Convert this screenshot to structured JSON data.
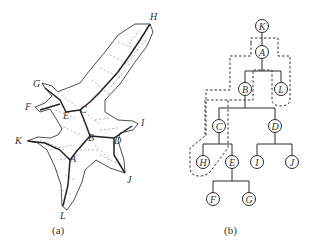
{
  "figure_a": {
    "caption": "(a)",
    "vertex_labels": [
      {
        "id": "H",
        "x": 150,
        "y": 20
      },
      {
        "id": "G",
        "x": 33,
        "y": 87
      },
      {
        "id": "F",
        "x": 25,
        "y": 110
      },
      {
        "id": "C",
        "x": 80,
        "y": 113
      },
      {
        "id": "E",
        "x": 63,
        "y": 119
      },
      {
        "id": "I",
        "x": 141,
        "y": 126
      },
      {
        "id": "K",
        "x": 15,
        "y": 144
      },
      {
        "id": "B",
        "x": 88,
        "y": 141
      },
      {
        "id": "D",
        "x": 114,
        "y": 144
      },
      {
        "id": "A",
        "x": 70,
        "y": 162
      },
      {
        "id": "J",
        "x": 127,
        "y": 183
      },
      {
        "id": "L",
        "x": 60,
        "y": 219
      }
    ]
  },
  "figure_b": {
    "caption": "(b)",
    "nodes": [
      {
        "id": "K",
        "x": 262,
        "y": 26
      },
      {
        "id": "A",
        "x": 262,
        "y": 52
      },
      {
        "id": "B",
        "x": 245,
        "y": 89
      },
      {
        "id": "L",
        "x": 281,
        "y": 89
      },
      {
        "id": "C",
        "x": 219,
        "y": 126
      },
      {
        "id": "D",
        "x": 275,
        "y": 126
      },
      {
        "id": "H",
        "x": 203,
        "y": 162
      },
      {
        "id": "E",
        "x": 232,
        "y": 162
      },
      {
        "id": "I",
        "x": 257,
        "y": 162
      },
      {
        "id": "J",
        "x": 292,
        "y": 162
      },
      {
        "id": "F",
        "x": 213,
        "y": 199
      },
      {
        "id": "G",
        "x": 249,
        "y": 199
      }
    ],
    "edges": [
      [
        "K",
        "A"
      ],
      [
        "A",
        "B"
      ],
      [
        "A",
        "L"
      ],
      [
        "B",
        "C"
      ],
      [
        "B",
        "D"
      ],
      [
        "C",
        "H"
      ],
      [
        "C",
        "E"
      ],
      [
        "D",
        "I"
      ],
      [
        "D",
        "J"
      ],
      [
        "E",
        "F"
      ],
      [
        "E",
        "G"
      ]
    ]
  },
  "colors": {
    "line": "#2a2a2a",
    "dash": "#333333",
    "text": "#333333"
  }
}
